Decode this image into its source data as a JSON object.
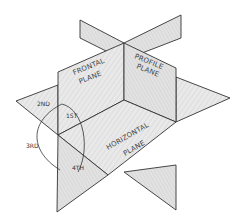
{
  "diagram": {
    "planes": {
      "frontal": {
        "line1": "FRONTAL",
        "line2": "PLANE"
      },
      "profile": {
        "line1": "PROFILE",
        "line2": "PLANE"
      },
      "horizontal": {
        "line1": "HORIZONTAL",
        "line2": "PLANE"
      }
    },
    "quadrants": {
      "first": "1ST",
      "second": "2ND",
      "third": "3RD",
      "fourth": "4TH"
    },
    "colors": {
      "line": "#333333",
      "shade_light": "#ececec",
      "shade_mid": "#dedede",
      "shade_dark": "#cfcfcf",
      "background": "#ffffff"
    }
  }
}
